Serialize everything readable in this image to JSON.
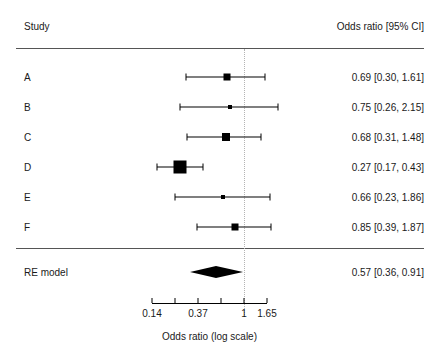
{
  "header": {
    "study_label": "Study",
    "estimate_label": "Odds ratio [95% CI]"
  },
  "summary_row": {
    "label": "RE model",
    "estimate_text": "0.57 [0.36, 0.91]"
  },
  "axis": {
    "title": "Odds ratio (log scale)",
    "tick_labels": [
      "0.14",
      "0.37",
      "1",
      "1.65"
    ]
  },
  "chart_data": {
    "type": "forest",
    "title": "",
    "xlabel": "Odds ratio (log scale)",
    "ylabel": "Study",
    "scale": "log",
    "reference_line": 1,
    "xlim": [
      0.14,
      1.65
    ],
    "axis_ticks": [
      {
        "value": 0.14,
        "label": "0.14",
        "x": 152
      },
      {
        "value": 0.22,
        "label": "",
        "x": 175
      },
      {
        "value": 0.37,
        "label": "0.37",
        "x": 198
      },
      {
        "value": 0.61,
        "label": "",
        "x": 221
      },
      {
        "value": 1,
        "label": "1",
        "x": 244
      },
      {
        "value": 1.65,
        "label": "1.65",
        "x": 267
      }
    ],
    "grid": false,
    "legend": "none",
    "columns": [
      "Study",
      "Odds ratio [95% CI]"
    ],
    "studies": [
      {
        "label": "A",
        "estimate": 0.69,
        "ci_lower": 0.3,
        "ci_upper": 1.61,
        "estimate_text": "0.69 [0.30, 1.61]",
        "marker_size": 7,
        "y": 77,
        "x_estimate": 227,
        "x_lower": 186,
        "x_upper": 265
      },
      {
        "label": "B",
        "estimate": 0.75,
        "ci_lower": 0.26,
        "ci_upper": 2.15,
        "estimate_text": "0.75 [0.26, 2.15]",
        "marker_size": 4,
        "y": 107,
        "x_estimate": 230,
        "x_lower": 180,
        "x_upper": 278
      },
      {
        "label": "C",
        "estimate": 0.68,
        "ci_lower": 0.31,
        "ci_upper": 1.48,
        "estimate_text": "0.68 [0.31, 1.48]",
        "marker_size": 8,
        "y": 137,
        "x_estimate": 226,
        "x_lower": 187,
        "x_upper": 261
      },
      {
        "label": "D",
        "estimate": 0.27,
        "ci_lower": 0.17,
        "ci_upper": 0.43,
        "estimate_text": "0.27 [0.17, 0.43]",
        "marker_size": 13,
        "y": 167,
        "x_estimate": 180,
        "x_lower": 157,
        "x_upper": 203
      },
      {
        "label": "E",
        "estimate": 0.66,
        "ci_lower": 0.23,
        "ci_upper": 1.86,
        "estimate_text": "0.66 [0.23, 1.86]",
        "marker_size": 4,
        "y": 197,
        "x_estimate": 223,
        "x_lower": 175,
        "x_upper": 270
      },
      {
        "label": "F",
        "estimate": 0.85,
        "ci_lower": 0.39,
        "ci_upper": 1.87,
        "estimate_text": "0.85 [0.39, 1.87]",
        "marker_size": 7,
        "y": 227,
        "x_estimate": 235,
        "x_lower": 197,
        "x_upper": 271
      }
    ],
    "summary": {
      "label": "RE model",
      "estimate": 0.57,
      "ci_lower": 0.36,
      "ci_upper": 0.91,
      "estimate_text": "0.57 [0.36, 0.91]",
      "y": 272,
      "x_estimate": 216,
      "x_lower": 190,
      "x_upper": 243
    }
  },
  "colors": {
    "marker": "#000000",
    "rule": "#555555",
    "reference": "#b4b4b4",
    "text": "#1a1a1a",
    "background": "#ffffff"
  }
}
